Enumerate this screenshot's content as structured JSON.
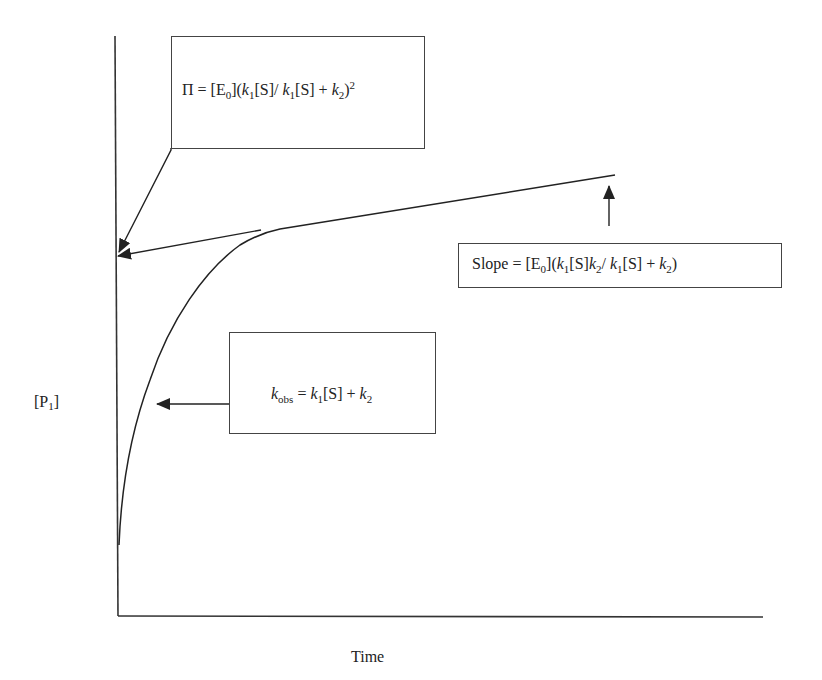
{
  "figure": {
    "y_axis_label": {
      "base": "[P",
      "sub": "1",
      "close": "]"
    },
    "x_axis_label": "Time",
    "annotations": {
      "intercept": {
        "parts": [
          {
            "t": "Π = [E"
          },
          {
            "sub": "0"
          },
          {
            "t": "]("
          },
          {
            "i": "k"
          },
          {
            "sub": "1"
          },
          {
            "t": "[S]/ "
          },
          {
            "i": "k"
          },
          {
            "sub": "1"
          },
          {
            "t": "[S] + "
          },
          {
            "i": "k"
          },
          {
            "sub": "2"
          },
          {
            "t": ")"
          },
          {
            "sup": "2"
          }
        ]
      },
      "slope": {
        "parts": [
          {
            "t": "Slope = [E"
          },
          {
            "sub": "0"
          },
          {
            "t": "]("
          },
          {
            "i": "k"
          },
          {
            "sub": "1"
          },
          {
            "t": "[S]"
          },
          {
            "i": "k"
          },
          {
            "sub": "2"
          },
          {
            "t": "/ "
          },
          {
            "i": "k"
          },
          {
            "sub": "1"
          },
          {
            "t": "[S] + "
          },
          {
            "i": "k"
          },
          {
            "sub": "2"
          },
          {
            "t": ")"
          }
        ]
      },
      "kobs": {
        "parts": [
          {
            "i": "k"
          },
          {
            "sub": "obs"
          },
          {
            "t": " = "
          },
          {
            "i": "k"
          },
          {
            "sub": "1"
          },
          {
            "t": "[S] + "
          },
          {
            "i": "k"
          },
          {
            "sub": "2"
          }
        ]
      }
    },
    "curve_description": "Burst kinetics: rapid exponential rise of [P1] followed by linear steady-state phase; tangent of linear phase extrapolated to y-axis gives burst amplitude Π",
    "colors": {
      "line": "#222222",
      "box_border": "#444444",
      "background": "#ffffff"
    }
  }
}
